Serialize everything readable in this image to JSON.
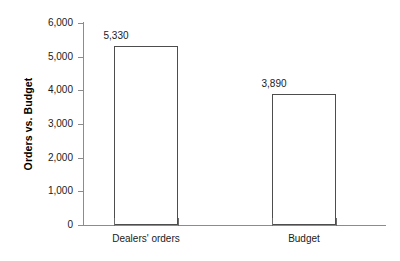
{
  "chart_data": {
    "type": "bar",
    "title": "",
    "subtitle": "",
    "xlabel": "",
    "ylabel": "Orders vs. Budget",
    "categories": [
      "Dealers' orders",
      "Budget"
    ],
    "values": [
      5330,
      3890
    ],
    "value_labels": [
      "5,330",
      "3,890"
    ],
    "ylim": [
      0,
      6000
    ],
    "ytick_values": [
      0,
      1000,
      2000,
      3000,
      4000,
      5000,
      6000
    ],
    "ytick_labels": [
      "0",
      "1,000",
      "2,000",
      "3,000",
      "4,000",
      "5,000",
      "6,000"
    ],
    "grid": false,
    "legend": null,
    "legend_position": "none",
    "annotations": [],
    "colors": {
      "bar_fill": "#ffffff",
      "bar_border": "#4d4d4d",
      "axis": "#8c8c8c",
      "text": "#1a1a1a",
      "background": "#ffffff"
    }
  }
}
